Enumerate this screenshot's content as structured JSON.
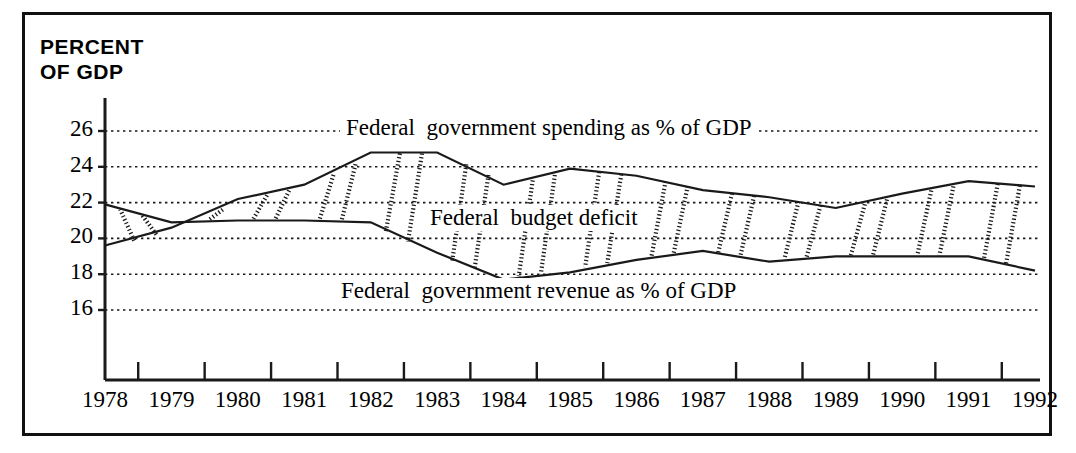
{
  "figure": {
    "title_line1": "PERCENT",
    "title_line2": "OF GDP",
    "title": "PERCENT\nOF GDP",
    "border_color": "#111111",
    "background": "#ffffff",
    "ink_color": "#1a1a1a"
  },
  "labels": {
    "spending": "Federal  government spending as % of GDP",
    "deficit": "Federal  budget deficit",
    "revenue": "Federal  government revenue as % of GDP"
  },
  "chart_data": {
    "type": "area",
    "title": "PERCENT OF GDP",
    "xlabel": "",
    "ylabel": "PERCENT OF GDP",
    "grid": true,
    "legend_position": "inline-annotations",
    "xlim": [
      1978,
      1992
    ],
    "ylim": [
      14.6,
      27.4
    ],
    "yticks": [
      16,
      18,
      20,
      22,
      24,
      26
    ],
    "ytick_labels": [
      "16",
      "18",
      "20",
      "22",
      "24",
      "26"
    ],
    "categories": [
      1978,
      1979,
      1980,
      1981,
      1982,
      1983,
      1984,
      1985,
      1986,
      1987,
      1988,
      1989,
      1990,
      1991,
      1992
    ],
    "xtick_labels": [
      "1978",
      "1979",
      "1980",
      "1981",
      "1982",
      "1983",
      "1984",
      "1985",
      "1986",
      "1987",
      "1988",
      "1989",
      "1990",
      "1991",
      "1992"
    ],
    "series": [
      {
        "name": "Federal  government spending as % of GDP",
        "values": [
          19.6,
          20.6,
          22.2,
          23.0,
          24.8,
          24.8,
          23.0,
          23.9,
          23.5,
          22.7,
          22.3,
          21.7,
          22.5,
          23.2,
          22.9
        ]
      },
      {
        "name": "Federal  government revenue as % of GDP",
        "values": [
          21.9,
          20.9,
          21.0,
          21.0,
          20.9,
          19.2,
          17.7,
          18.1,
          18.8,
          19.3,
          18.7,
          19.0,
          19.0,
          19.0,
          18.2
        ]
      }
    ],
    "fill_between_label": "Federal  budget deficit",
    "fill_pattern": "vertical-hatch"
  }
}
